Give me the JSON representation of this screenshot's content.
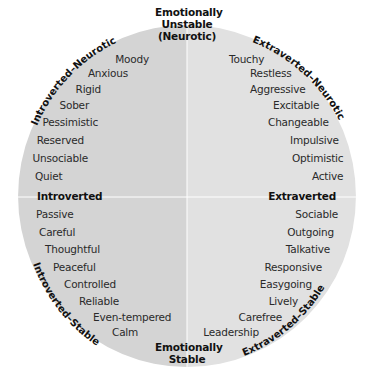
{
  "diagram": {
    "type": "personality-circle",
    "colors": {
      "left_fill": "#d4d4d4",
      "right_fill": "#e1e1e1",
      "divider": "#ffffff",
      "background": "#ffffff"
    },
    "poles": {
      "top": [
        "Emotionally",
        "Unstable",
        "(Neurotic)"
      ],
      "bottom": [
        "Emotionally",
        "Stable"
      ],
      "left": "Introverted",
      "right": "Extraverted"
    },
    "quadrant_labels": {
      "top_left": "Introverted–Neurotic",
      "top_right": "Extraverted–Neurotic",
      "bottom_left": "Introverted–Stable",
      "bottom_right": "Extraverted–Stable"
    },
    "traits": {
      "top_left": [
        "Moody",
        "Anxious",
        "Rigid",
        "Sober",
        "Pessimistic",
        "Reserved",
        "Unsociable",
        "Quiet"
      ],
      "top_right": [
        "Touchy",
        "Restless",
        "Aggressive",
        "Excitable",
        "Changeable",
        "Impulsive",
        "Optimistic",
        "Active"
      ],
      "bottom_left": [
        "Passive",
        "Careful",
        "Thoughtful",
        "Peaceful",
        "Controlled",
        "Reliable",
        "Even-tempered",
        "Calm"
      ],
      "bottom_right": [
        "Sociable",
        "Outgoing",
        "Talkative",
        "Responsive",
        "Easygoing",
        "Lively",
        "Carefree",
        "Leadership"
      ]
    }
  }
}
